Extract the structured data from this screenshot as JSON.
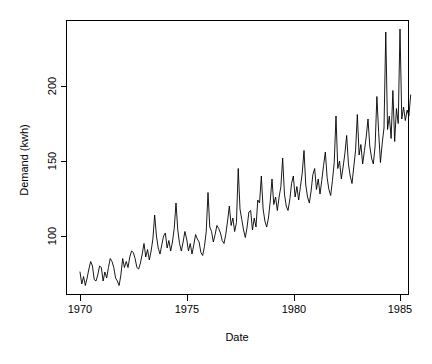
{
  "chart_data": {
    "type": "line",
    "title": "",
    "xlabel": "Date",
    "ylabel": "Demand (kwh)",
    "xlim": [
      1969.95,
      1985.0
    ],
    "ylim": [
      60,
      240
    ],
    "grid": false,
    "legend": "none",
    "xticks": [
      1970,
      1975,
      1980,
      1985
    ],
    "xticklabels": [
      "1970",
      "1975",
      "1980",
      "1985"
    ],
    "yticks": [
      100,
      150,
      200
    ],
    "yticklabels": [
      "100",
      "150",
      "200"
    ],
    "series_name": "Demand",
    "line_color": "#000000",
    "x_start": 1970.0,
    "x_step": 0.0833333,
    "frequency": "monthly",
    "n_points": 180,
    "values": [
      76,
      68,
      73,
      67,
      72,
      78,
      83,
      80,
      71,
      70,
      74,
      80,
      79,
      70,
      76,
      72,
      79,
      85,
      83,
      79,
      72,
      70,
      67,
      74,
      85,
      79,
      83,
      79,
      86,
      90,
      89,
      85,
      79,
      78,
      82,
      88,
      95,
      86,
      91,
      84,
      90,
      98,
      114,
      100,
      92,
      88,
      94,
      100,
      102,
      92,
      97,
      90,
      96,
      105,
      122,
      104,
      95,
      90,
      96,
      103,
      98,
      90,
      95,
      88,
      94,
      101,
      98,
      96,
      89,
      87,
      93,
      103,
      129,
      106,
      103,
      96,
      101,
      107,
      105,
      102,
      97,
      95,
      101,
      110,
      120,
      107,
      112,
      103,
      109,
      145,
      118,
      111,
      104,
      99,
      106,
      116,
      117,
      104,
      112,
      106,
      124,
      122,
      140,
      118,
      110,
      106,
      112,
      123,
      138,
      121,
      126,
      117,
      126,
      133,
      152,
      128,
      120,
      117,
      124,
      135,
      140,
      126,
      133,
      124,
      133,
      142,
      157,
      134,
      126,
      122,
      130,
      141,
      145,
      131,
      138,
      128,
      137,
      147,
      156,
      139,
      131,
      127,
      137,
      149,
      180,
      145,
      150,
      138,
      146,
      155,
      167,
      148,
      140,
      135,
      146,
      157,
      181,
      154,
      161,
      148,
      157,
      166,
      178,
      160,
      152,
      148,
      160,
      193,
      169,
      149,
      162,
      172,
      236,
      171,
      180,
      165,
      197,
      163,
      185,
      175,
      238,
      178,
      186,
      177,
      184,
      180,
      194
    ],
    "axis_geometry": {
      "plot_left_px": 66,
      "plot_right_px": 409,
      "plot_top_px": 20,
      "plot_bottom_px": 295,
      "y_tick_px": {
        "200": 86,
        "150": 161,
        "100": 236
      },
      "x_tick_px": {
        "1970": 80,
        "1975": 187,
        "1980": 294,
        "1985": 400
      }
    }
  }
}
